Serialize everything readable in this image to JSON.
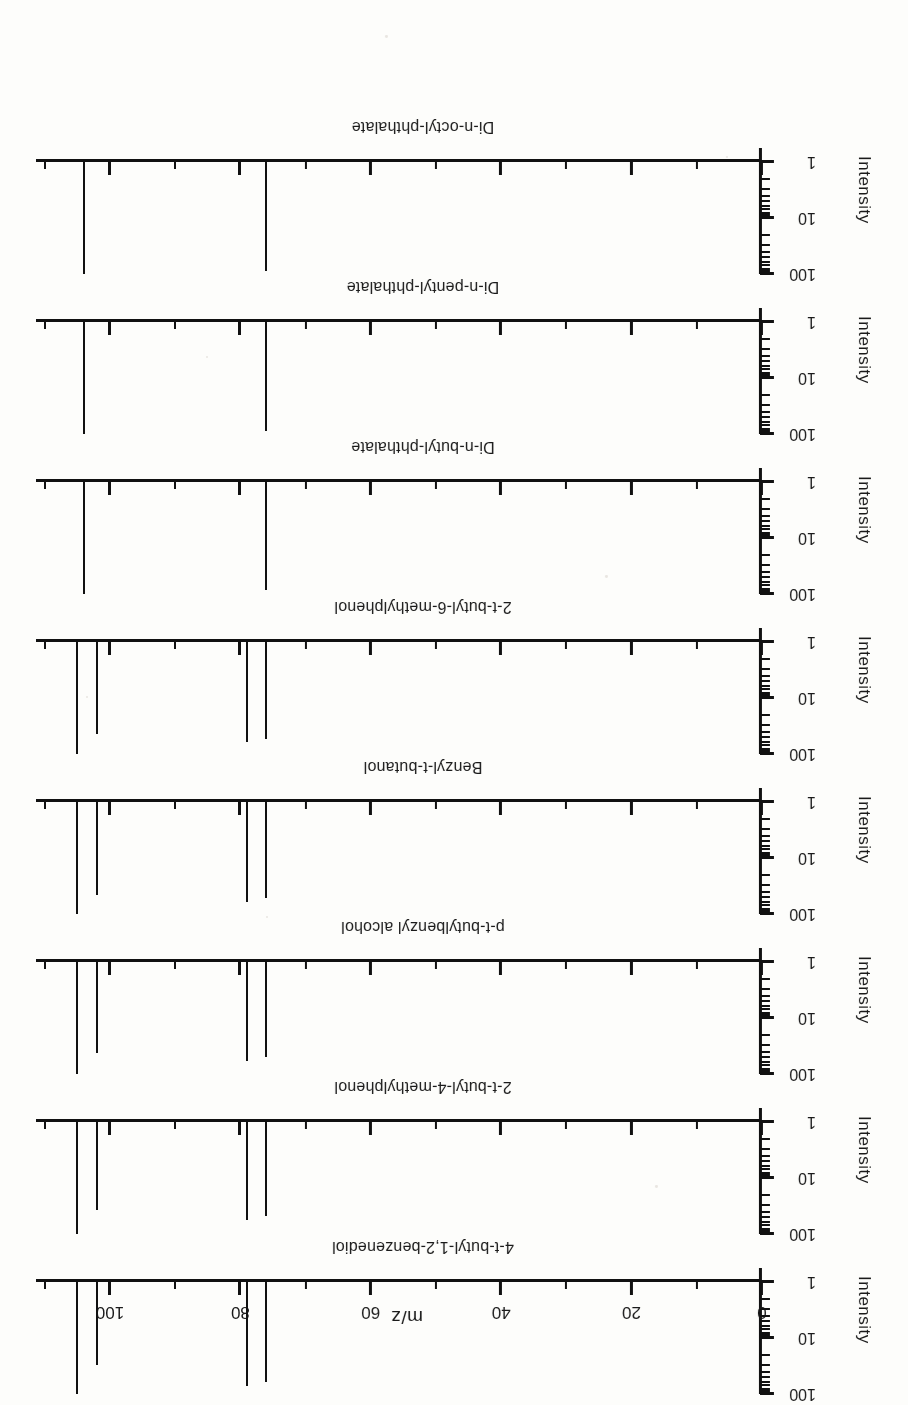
{
  "figure": {
    "orientation": "rotated-180",
    "x_axis_title": "m/z",
    "y_axis_title": "Intensity",
    "y_tick_labels": [
      "1",
      "10",
      "100"
    ],
    "x_tick_labels": [
      "0",
      "20",
      "40",
      "60",
      "80",
      "100"
    ],
    "ink_color": "#111111",
    "paper_color": "#fdfdfb"
  },
  "chart_data": {
    "type": "bar",
    "title": "",
    "xlabel": "m/z",
    "ylabel": "Intensity",
    "xlim": [
      0,
      110
    ],
    "ylim": [
      1,
      100
    ],
    "yscale": "log",
    "grid": false,
    "legend": "none",
    "xticks": [
      0,
      20,
      40,
      60,
      80,
      100
    ],
    "xticks_minor": [
      10,
      30,
      50,
      70,
      90,
      110
    ],
    "yticks": [
      1,
      10,
      100
    ],
    "panels": [
      {
        "label": "4-t-butyl-1,2-benzenediol",
        "x": [
          105,
          102,
          79,
          76
        ],
        "values": [
          100,
          30,
          72,
          60
        ]
      },
      {
        "label": "2-t-butyl-4-methylphenol",
        "x": [
          105,
          102,
          79,
          76
        ],
        "values": [
          100,
          38,
          56,
          48
        ]
      },
      {
        "label": "p-t-butylbenzyl alcohol",
        "x": [
          105,
          102,
          79,
          76
        ],
        "values": [
          100,
          42,
          58,
          50
        ]
      },
      {
        "label": "Benzyl-t-butanol",
        "x": [
          105,
          102,
          79,
          76
        ],
        "values": [
          100,
          46,
          60,
          52
        ]
      },
      {
        "label": "2-t-butyl-6-methylphenol",
        "x": [
          105,
          102,
          79,
          76
        ],
        "values": [
          100,
          44,
          62,
          54
        ]
      },
      {
        "label": "Di-n-butyl-phthalate",
        "x": [
          104,
          76
        ],
        "values": [
          100,
          86
        ]
      },
      {
        "label": "Di-n-pentyl-phthalate",
        "x": [
          104,
          76
        ],
        "values": [
          100,
          88
        ]
      },
      {
        "label": "Di-n-octyl-phthalate",
        "x": [
          104,
          76
        ],
        "values": [
          100,
          90
        ]
      }
    ]
  }
}
